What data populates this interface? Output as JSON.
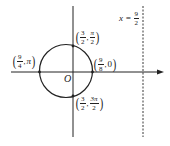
{
  "diagram": {
    "type": "polar-circle-plot",
    "colors": {
      "stroke": "#222222",
      "background": "#ffffff"
    },
    "origin_label": "O",
    "asymptote": {
      "label_lhs": "x =",
      "label_num": "9",
      "label_den": "2",
      "style": "dashed"
    },
    "points": [
      {
        "id": "top",
        "num_r": "3",
        "den_r": "2",
        "theta_num": "π",
        "theta_den": "2"
      },
      {
        "id": "right",
        "r_num": "9",
        "r_den": "8",
        "theta": "0"
      },
      {
        "id": "left",
        "r_num": "9",
        "r_den": "4",
        "theta": "π"
      },
      {
        "id": "bottom",
        "num_r": "3",
        "den_r": "2",
        "theta_num": "3π",
        "theta_den": "2"
      }
    ]
  }
}
